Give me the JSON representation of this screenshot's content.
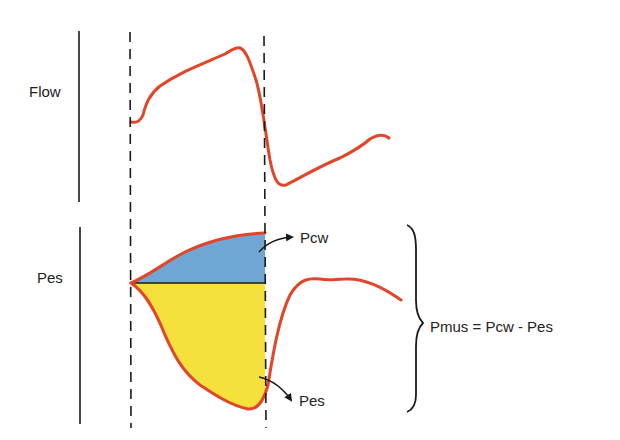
{
  "labels": {
    "flow": "Flow",
    "pes_axis": "Pes",
    "pcw_arrow": "Pcw",
    "pes_arrow": "Pes",
    "equation": "Pmus = Pcw - Pes"
  },
  "colors": {
    "trace": "#e2452a",
    "pcw_fill": "#6fa6d4",
    "pes_fill": "#f6e03c",
    "axis": "#1a1a1a",
    "background": "#ffffff"
  },
  "diagram": {
    "panels": [
      {
        "name": "Flow",
        "trace": "flow waveform"
      },
      {
        "name": "Pes",
        "trace": "esophageal pressure waveform",
        "regions": [
          "Pcw",
          "Pes"
        ]
      }
    ],
    "markers": [
      "inspiration start (dashed)",
      "inspiration end (dashed)"
    ]
  }
}
